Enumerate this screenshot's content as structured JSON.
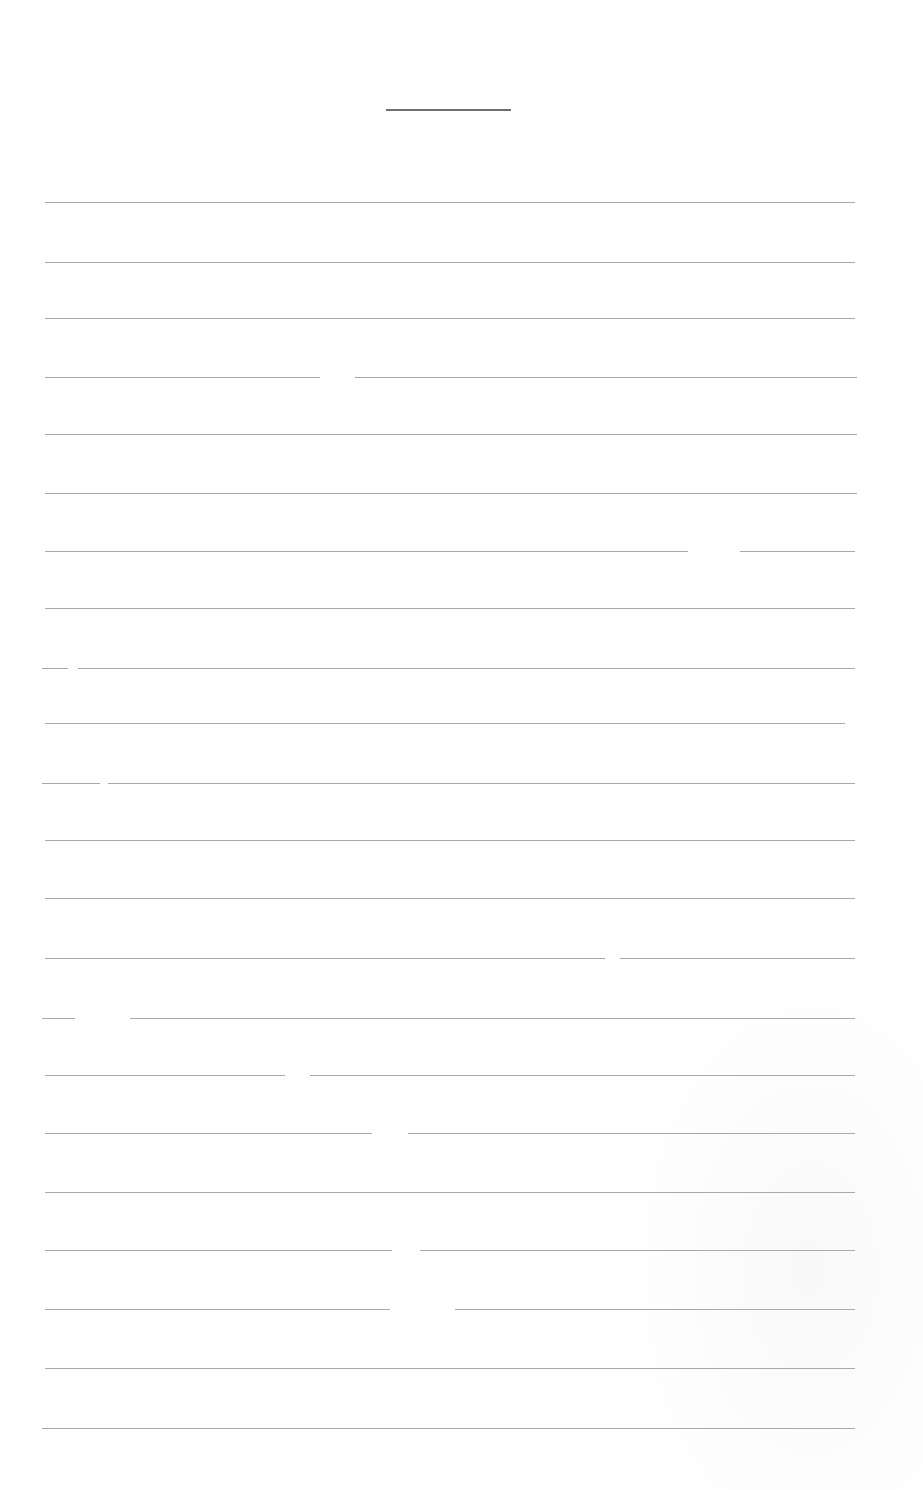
{
  "document": {
    "type": "blank lined form",
    "title_underline": {
      "x": 386,
      "y": 109,
      "width": 125
    },
    "rule_color": "#a8a8a8",
    "title_color": "#6f6f6f",
    "lines": [
      {
        "y": 202,
        "segments": [
          [
            45,
            855
          ]
        ]
      },
      {
        "y": 262,
        "segments": [
          [
            45,
            855
          ]
        ]
      },
      {
        "y": 318,
        "segments": [
          [
            45,
            855
          ]
        ]
      },
      {
        "y": 377,
        "segments": [
          [
            45,
            320
          ],
          [
            355,
            857
          ]
        ]
      },
      {
        "y": 434,
        "segments": [
          [
            45,
            857
          ]
        ]
      },
      {
        "y": 493,
        "segments": [
          [
            45,
            857
          ]
        ]
      },
      {
        "y": 551,
        "segments": [
          [
            45,
            688
          ],
          [
            740,
            855
          ]
        ]
      },
      {
        "y": 608,
        "segments": [
          [
            45,
            855
          ]
        ]
      },
      {
        "y": 668,
        "segments": [
          [
            42,
            68
          ],
          [
            78,
            855
          ]
        ]
      },
      {
        "y": 723,
        "segments": [
          [
            45,
            845
          ]
        ]
      },
      {
        "y": 783,
        "segments": [
          [
            42,
            100
          ],
          [
            108,
            855
          ]
        ]
      },
      {
        "y": 840,
        "segments": [
          [
            45,
            855
          ]
        ]
      },
      {
        "y": 898,
        "segments": [
          [
            45,
            855
          ]
        ]
      },
      {
        "y": 958,
        "segments": [
          [
            45,
            605
          ],
          [
            620,
            855
          ]
        ]
      },
      {
        "y": 1018,
        "segments": [
          [
            42,
            75
          ],
          [
            130,
            855
          ]
        ]
      },
      {
        "y": 1075,
        "segments": [
          [
            45,
            285
          ],
          [
            310,
            855
          ]
        ]
      },
      {
        "y": 1133,
        "segments": [
          [
            45,
            372
          ],
          [
            408,
            855
          ]
        ]
      },
      {
        "y": 1192,
        "segments": [
          [
            45,
            855
          ]
        ]
      },
      {
        "y": 1250,
        "segments": [
          [
            45,
            392
          ],
          [
            420,
            855
          ]
        ]
      },
      {
        "y": 1309,
        "segments": [
          [
            45,
            390
          ],
          [
            455,
            855
          ]
        ]
      },
      {
        "y": 1368,
        "segments": [
          [
            45,
            855
          ]
        ]
      },
      {
        "y": 1428,
        "segments": [
          [
            42,
            855
          ]
        ]
      }
    ]
  }
}
